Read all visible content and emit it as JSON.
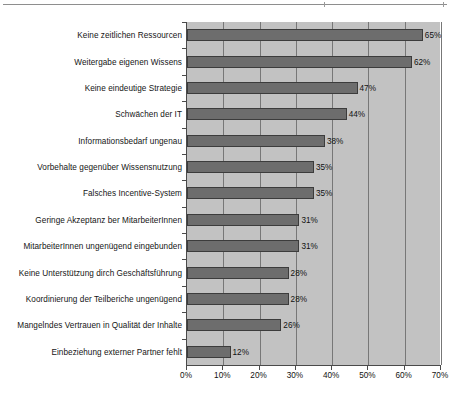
{
  "page": {
    "background_color": "#ffffff",
    "rule_color": "#8e8e8e"
  },
  "chart_data": {
    "type": "bar",
    "orientation": "horizontal",
    "title": "",
    "subtitle": "",
    "xlabel": "",
    "ylabel": "",
    "xlim": [
      0,
      70
    ],
    "xtick_step": 10,
    "grid": true,
    "grid_axis": "x",
    "legend": false,
    "legend_position": "none",
    "value_suffix": "%",
    "plot_background_color": "#c2c2c2",
    "bar_color": "#6d6d6d",
    "bar_edge_color": "#3c3c3c",
    "axis_color": "#4a4a4a",
    "gridline_color": "#777777",
    "xticks": [
      0,
      10,
      20,
      30,
      40,
      50,
      60,
      70
    ],
    "xticklabels": [
      "0%",
      "10%",
      "20%",
      "30%",
      "40%",
      "50%",
      "60%",
      "70%"
    ],
    "categories": [
      "Keine zeitlichen Ressourcen",
      "Weitergabe eigenen Wissens",
      "Keine eindeutige Strategie",
      "Schwächen der IT",
      "Informationsbedarf ungenau",
      "Vorbehalte gegenüber Wissensnutzung",
      "Falsches Incentive-System",
      "Geringe Akzeptanz ber MitarbeiterInnen",
      "MitarbeiterInnen ungenügend eingebunden",
      "Keine Unterstützung dirch Geschäftsführung",
      "Koordinierung der Teilberiche ungenügend",
      "Mangelndes Vertrauen in Qualität der Inhalte",
      "Einbeziehung externer Partner fehlt"
    ],
    "values": [
      65,
      62,
      47,
      44,
      38,
      35,
      35,
      31,
      31,
      28,
      28,
      26,
      12
    ],
    "data_labels": [
      "65%",
      "62%",
      "47%",
      "44%",
      "38%",
      "35%",
      "35%",
      "31%",
      "31%",
      "28%",
      "28%",
      "26%",
      "12%"
    ]
  }
}
